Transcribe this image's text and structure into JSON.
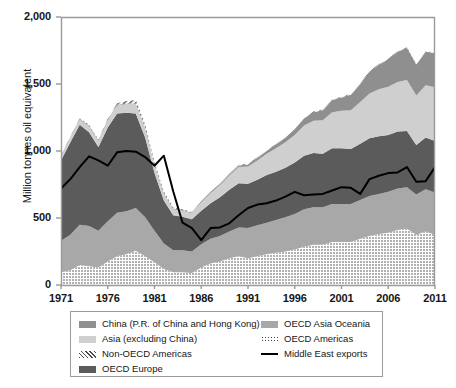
{
  "chart_data": {
    "type": "area",
    "title": "",
    "subtitle": "",
    "xlabel": "",
    "ylabel": "Million tonnes oil equivalent",
    "stacked": true,
    "grid": false,
    "legend_position": "bottom",
    "xlim": [
      1971,
      2011
    ],
    "ylim": [
      0,
      2000
    ],
    "yticks": [
      "0",
      "500",
      "1,000",
      "1,500",
      "2,000"
    ],
    "ytick_values": [
      0,
      500,
      1000,
      1500,
      2000
    ],
    "xticks": [
      "1971",
      "1976",
      "1981",
      "1986",
      "1991",
      "1996",
      "2001",
      "2006",
      "2011"
    ],
    "xtick_values": [
      1971,
      1976,
      1981,
      1986,
      1991,
      1996,
      2001,
      2006,
      2011
    ],
    "x": [
      1971,
      1972,
      1973,
      1974,
      1975,
      1976,
      1977,
      1978,
      1979,
      1980,
      1981,
      1982,
      1983,
      1984,
      1985,
      1986,
      1987,
      1988,
      1989,
      1990,
      1991,
      1992,
      1993,
      1994,
      1995,
      1996,
      1997,
      1998,
      1999,
      2000,
      2001,
      2002,
      2003,
      2004,
      2005,
      2006,
      2007,
      2008,
      2009,
      2010,
      2011
    ],
    "series": [
      {
        "name": "OECD Americas",
        "pattern": "dotted",
        "color": "#ffffff",
        "values": [
          95,
          110,
          150,
          140,
          130,
          175,
          215,
          230,
          255,
          215,
          170,
          120,
          95,
          95,
          90,
          130,
          160,
          175,
          200,
          215,
          200,
          215,
          230,
          240,
          250,
          265,
          285,
          300,
          300,
          320,
          320,
          320,
          345,
          365,
          380,
          390,
          410,
          420,
          375,
          400,
          375
        ]
      },
      {
        "name": "OECD Asia Oceania",
        "pattern": "solid",
        "color": "#a8a8a8",
        "values": [
          235,
          265,
          300,
          300,
          275,
          300,
          325,
          320,
          320,
          290,
          235,
          190,
          165,
          165,
          160,
          175,
          185,
          190,
          200,
          215,
          225,
          230,
          235,
          245,
          255,
          265,
          280,
          280,
          280,
          285,
          285,
          285,
          290,
          300,
          300,
          305,
          310,
          310,
          300,
          315,
          315
        ]
      },
      {
        "name": "OECD Europe",
        "pattern": "solid",
        "color": "#5b5b5b",
        "values": [
          600,
          690,
          745,
          700,
          625,
          700,
          740,
          735,
          705,
          595,
          430,
          320,
          260,
          250,
          240,
          250,
          265,
          290,
          310,
          330,
          330,
          340,
          355,
          360,
          370,
          385,
          400,
          405,
          400,
          415,
          415,
          410,
          420,
          430,
          430,
          425,
          425,
          420,
          370,
          385,
          385
        ]
      },
      {
        "name": "Asia (excluding China)",
        "pattern": "solid",
        "color": "#cfcfcf",
        "values": [
          30,
          35,
          40,
          45,
          45,
          55,
          60,
          65,
          70,
          70,
          60,
          50,
          45,
          45,
          45,
          60,
          75,
          90,
          105,
          120,
          130,
          145,
          160,
          175,
          190,
          205,
          225,
          240,
          250,
          270,
          280,
          290,
          310,
          335,
          350,
          360,
          370,
          380,
          370,
          390,
          400
        ]
      },
      {
        "name": "China (P.R. of China and Hong Kong)",
        "pattern": "solid",
        "color": "#8f8f8f",
        "values": [
          5,
          5,
          5,
          5,
          5,
          5,
          5,
          5,
          5,
          5,
          5,
          5,
          5,
          5,
          5,
          5,
          5,
          8,
          10,
          12,
          15,
          18,
          22,
          28,
          35,
          45,
          55,
          65,
          75,
          90,
          100,
          115,
          135,
          160,
          185,
          205,
          225,
          240,
          230,
          250,
          255
        ]
      },
      {
        "name": "Non-OECD Americas",
        "pattern": "hatched",
        "color": "#ffffff",
        "values": [
          3,
          4,
          5,
          5,
          5,
          8,
          12,
          18,
          25,
          22,
          18,
          12,
          8,
          6,
          5,
          5,
          5,
          5,
          5,
          5,
          5,
          5,
          5,
          5,
          5,
          5,
          5,
          5,
          5,
          5,
          5,
          5,
          5,
          5,
          5,
          5,
          5,
          5,
          5,
          5,
          5
        ]
      }
    ],
    "overlay_line": {
      "name": "Middle East exports",
      "color": "#000000",
      "values": [
        720,
        790,
        880,
        960,
        930,
        890,
        990,
        1000,
        995,
        955,
        890,
        965,
        700,
        465,
        425,
        335,
        425,
        430,
        460,
        520,
        575,
        600,
        610,
        630,
        660,
        695,
        670,
        675,
        680,
        705,
        730,
        725,
        680,
        790,
        815,
        835,
        840,
        880,
        770,
        775,
        880
      ]
    }
  },
  "legend": {
    "columns": [
      {
        "items": [
          {
            "label": "China (P.R. of China and Hong Kong)",
            "swatch": "china-swatch"
          },
          {
            "label": "Asia (excluding China)",
            "swatch": "asia-swatch"
          },
          {
            "label": "Non-OECD Americas",
            "swatch": "non-oecd-americas-swatch"
          },
          {
            "label": "OECD Europe",
            "swatch": "oecd-europe-swatch"
          }
        ]
      },
      {
        "items": [
          {
            "label": "OECD Asia Oceania",
            "swatch": "oecd-asia-oceania-swatch"
          },
          {
            "label": "OECD Americas",
            "swatch": "oecd-americas-swatch"
          },
          {
            "label": "Middle East exports",
            "swatch": "middle-east-exports-swatch"
          }
        ]
      }
    ]
  },
  "colors": {
    "china": "#8f8f8f",
    "asia_excluding_china": "#cfcfcf",
    "oecd_europe": "#5b5b5b",
    "oecd_asia_oceania": "#a8a8a8",
    "oecd_americas": "#ffffff",
    "non_oecd_americas": "#ffffff",
    "middle_east_exports_line": "#000000",
    "axis": "#9a9a9a",
    "text": "#161616",
    "background": "#ffffff"
  }
}
